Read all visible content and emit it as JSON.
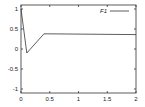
{
  "chart_data": {
    "type": "line",
    "title": "",
    "xlabel": "",
    "ylabel": "",
    "xlim": [
      0,
      2
    ],
    "ylim": [
      -1.1,
      1.1
    ],
    "grid": false,
    "legend_position": "top-right",
    "x_ticks": [
      0,
      0.5,
      1,
      1.5,
      2
    ],
    "x_tick_labels": [
      "0",
      "0.5",
      "1",
      "1.5",
      "2"
    ],
    "y_ticks": [
      1,
      0.5,
      0,
      -0.5,
      -1
    ],
    "y_tick_labels": [
      "1",
      "0.5",
      "0",
      "-0.5",
      "-1"
    ],
    "series": [
      {
        "name": "F1",
        "color": "#333333",
        "x": [
          0,
          0.1,
          0.4,
          2.0
        ],
        "y": [
          1.0,
          -0.1,
          0.38,
          0.36
        ]
      }
    ]
  },
  "colors": {
    "axis": "#333333",
    "background": "#ffffff"
  }
}
